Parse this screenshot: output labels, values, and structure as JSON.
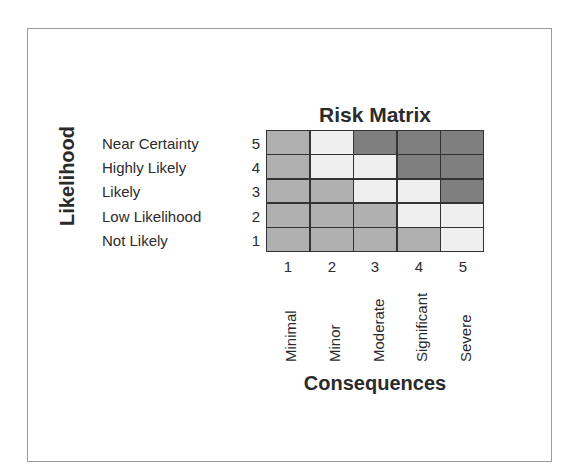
{
  "title": "Risk Matrix",
  "y_axis": {
    "label": "Likelihood",
    "rows": [
      {
        "num": "5",
        "label": "Near Certainty"
      },
      {
        "num": "4",
        "label": "Highly Likely"
      },
      {
        "num": "3",
        "label": "Likely"
      },
      {
        "num": "2",
        "label": "Low Likelihood"
      },
      {
        "num": "1",
        "label": "Not Likely"
      }
    ]
  },
  "x_axis": {
    "label": "Consequences",
    "cols": [
      {
        "num": "1",
        "label": "Minimal"
      },
      {
        "num": "2",
        "label": "Minor"
      },
      {
        "num": "3",
        "label": "Moderate"
      },
      {
        "num": "4",
        "label": "Significant"
      },
      {
        "num": "5",
        "label": "Severe"
      }
    ]
  },
  "colors": {
    "low": "#b0b0b0",
    "medium": "#efefef",
    "high": "#7f7f7f",
    "grid_line": "#333333",
    "frame": "#9a9a9a"
  },
  "matrix": [
    [
      "low",
      "medium",
      "high",
      "high",
      "high"
    ],
    [
      "low",
      "medium",
      "medium",
      "high",
      "high"
    ],
    [
      "low",
      "low",
      "medium",
      "medium",
      "high"
    ],
    [
      "low",
      "low",
      "low",
      "medium",
      "medium"
    ],
    [
      "low",
      "low",
      "low",
      "low",
      "medium"
    ]
  ]
}
